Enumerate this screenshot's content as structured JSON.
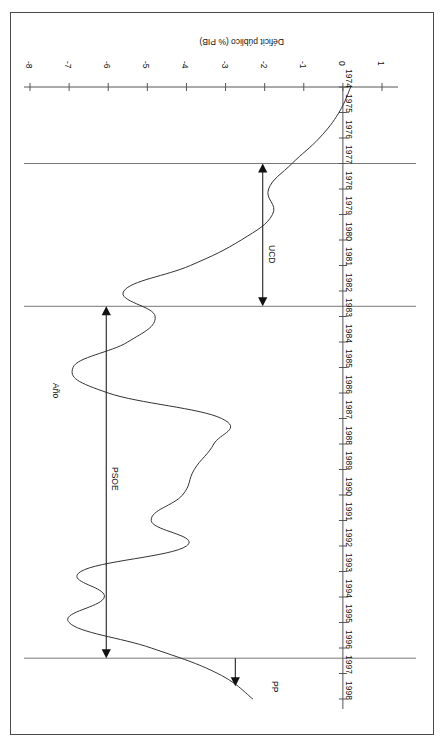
{
  "figure": {
    "rotation_degrees": 180,
    "background_color": "#ffffff",
    "frame_color": "#4a4a4a",
    "line_color": "#333333"
  },
  "chart_data": {
    "type": "line",
    "title": "",
    "xlabel": "Año",
    "ylabel": "Déficit público (% PIB)",
    "xlim": [
      1974,
      1998
    ],
    "ylim": [
      -8,
      1
    ],
    "grid": false,
    "legend": "none",
    "xtick_labels": [
      "1974",
      "1975",
      "1976",
      "1977",
      "1978",
      "1979",
      "1980",
      "1981",
      "1982",
      "1983",
      "1984",
      "1985",
      "1986",
      "1987",
      "1988",
      "1989",
      "1990",
      "1991",
      "1992",
      "1993",
      "1994",
      "1995",
      "1996",
      "1997",
      "1998"
    ],
    "ytick_labels": [
      "1",
      "0",
      "-1",
      "-2",
      "-3",
      "-4",
      "-5",
      "-6",
      "-7",
      "-8"
    ],
    "ytick_values": [
      1,
      0,
      -1,
      -2,
      -3,
      -4,
      -5,
      -6,
      -7,
      -8
    ],
    "series": [
      {
        "name": "Déficit público (% PIB)",
        "x": [
          1974,
          1975,
          1976,
          1977,
          1978,
          1979,
          1980,
          1981,
          1982,
          1983,
          1984,
          1985,
          1986,
          1987,
          1988,
          1989,
          1990,
          1991,
          1992,
          1993,
          1994,
          1995,
          1996,
          1997,
          1998
        ],
        "values": [
          0.2,
          -0.1,
          -0.6,
          -1.3,
          -1.9,
          -1.8,
          -2.6,
          -3.9,
          -5.6,
          -4.8,
          -5.5,
          -6.9,
          -6.0,
          -3.1,
          -3.3,
          -3.8,
          -4.1,
          -4.9,
          -4.0,
          -6.7,
          -6.1,
          -7.0,
          -4.9,
          -3.2,
          -2.3
        ],
        "annotations_on_curve": []
      }
    ],
    "annotations": [
      {
        "label": "UCD",
        "type": "double-headed-arrow",
        "x_start": 1977.0,
        "x_end": 1982.6,
        "note": "periodo de gobierno"
      },
      {
        "label": "PSOE",
        "type": "double-headed-arrow",
        "x_start": 1982.6,
        "x_end": 1996.4,
        "note": "periodo de gobierno"
      },
      {
        "label": "PP",
        "type": "single-arrow",
        "x_start": 1996.4,
        "x_end": 1998.0,
        "note": "periodo de gobierno"
      }
    ],
    "vertical_rules": [
      {
        "x": 1977.0,
        "note": "inicio UCD"
      },
      {
        "x": 1982.6,
        "note": "inicio PSOE"
      },
      {
        "x": 1996.4,
        "note": "inicio PP"
      }
    ]
  },
  "axis": {
    "x_title": "Año",
    "y_title": "Déficit público (% PIB)"
  },
  "annotations": {
    "ucd": "UCD",
    "psoe": "PSOE",
    "pp": "PP"
  }
}
